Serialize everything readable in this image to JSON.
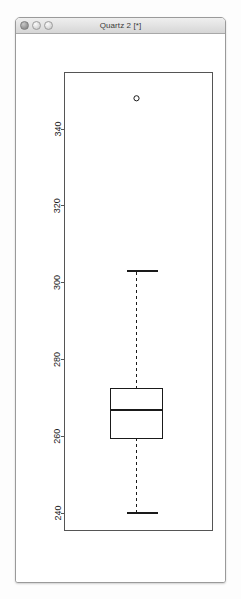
{
  "window": {
    "title": "Quartz 2 [*]",
    "traffic_lights": [
      {
        "name": "close-button",
        "color": "#9b9b9b"
      },
      {
        "name": "minimize-button",
        "color": "#dcdcdc"
      },
      {
        "name": "zoom-button",
        "color": "#dcdcdc"
      }
    ]
  },
  "chart_data": {
    "type": "box",
    "title": "",
    "xlabel": "",
    "ylabel": "",
    "ylim": [
      236,
      352
    ],
    "grid": false,
    "legend": null,
    "categories": [
      ""
    ],
    "axis": {
      "ticks": [
        240,
        260,
        280,
        300,
        320,
        340
      ],
      "tick_labels": [
        "240",
        "260",
        "280",
        "300",
        "320",
        "340"
      ],
      "label_rotation": 90,
      "side": "left"
    },
    "frame": {
      "visible": true,
      "color": "#555555"
    },
    "boxes": [
      {
        "name": "box-1",
        "min_whisker": 240,
        "q1": 259.5,
        "median": 266.8,
        "q3": 272.3,
        "max_whisker": 303,
        "outliers": [
          348
        ],
        "box_color": "#ffffff",
        "line_color": "#1a1a1a",
        "whisker_style": "dashed"
      }
    ]
  }
}
